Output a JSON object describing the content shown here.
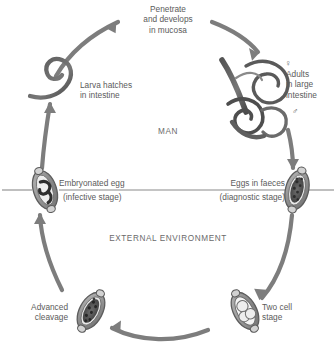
{
  "diagram": {
    "zones": {
      "host": "MAN",
      "environment": "EXTERNAL ENVIRONMENT"
    },
    "colors": {
      "arrow": "#7d7d7d",
      "text": "#5b5b5b",
      "divider": "#8a8a8a",
      "organism_dark": "#4a4a4a",
      "organism_fill": "#c8c8c8",
      "background": "#ffffff"
    },
    "stages": [
      {
        "id": "penetrate",
        "label": "Penetrate\nand develops\nin mucosa",
        "align": "center"
      },
      {
        "id": "adults",
        "label": "Adults\nin large\nintestine",
        "align": "left",
        "female_symbol": "♀",
        "male_symbol": "♂"
      },
      {
        "id": "eggs-in-faeces",
        "label": "Eggs in faeces",
        "sublabel": "(diagnostic stage)",
        "align": "right"
      },
      {
        "id": "two-cell",
        "label": "Two cell\nstage",
        "align": "left"
      },
      {
        "id": "advanced-cleavage",
        "label": "Advanced\ncleavage",
        "align": "right"
      },
      {
        "id": "embryonated-egg",
        "label": "Embryonated egg",
        "sublabel": "(infective stage)",
        "align": "left"
      },
      {
        "id": "larva-hatches",
        "label": "Larva hatches\nin intestine",
        "align": "left"
      }
    ]
  }
}
